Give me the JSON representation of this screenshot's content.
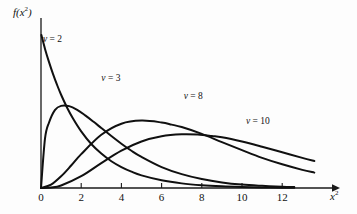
{
  "chart_data": {
    "type": "line",
    "title": "",
    "subtitle": "",
    "xlabel": "x²",
    "ylabel": "f(x²)",
    "xlabel_html": "x<sup>2</sup>",
    "ylabel_html": "f(x<sup>2</sup>)",
    "grid": false,
    "legend_position": "inline-annotations",
    "xlim": [
      0,
      13.8
    ],
    "ylim": [
      0,
      0.52
    ],
    "xticks": [
      0,
      2,
      4,
      6,
      8,
      10,
      12
    ],
    "xtick_labels": [
      "0",
      "2",
      "4",
      "6",
      "8",
      "10",
      "12"
    ],
    "yticks": [],
    "ytick_labels": [],
    "series": [
      {
        "name": "ν = 2",
        "label": "ν = 2",
        "nu": 2,
        "color": "#101010",
        "annotation": {
          "text": "ν = 2",
          "x": 0.1,
          "y": 0.48
        },
        "x": [
          0.02,
          0.2,
          0.4,
          0.6,
          0.8,
          1.0,
          1.3,
          1.6,
          2.0,
          2.5,
          3.0,
          3.5,
          4.0,
          4.5,
          5.0,
          6.0,
          7.0,
          8.0,
          9.0,
          10.0,
          11.0,
          12.0,
          12.6
        ],
        "y": [
          0.497,
          0.452,
          0.409,
          0.37,
          0.335,
          0.303,
          0.261,
          0.225,
          0.184,
          0.143,
          0.112,
          0.087,
          0.068,
          0.053,
          0.041,
          0.025,
          0.015,
          0.009,
          0.0055,
          0.0034,
          0.002,
          0.0012,
          0.0009
        ]
      },
      {
        "name": "ν = 3",
        "label": "ν = 3",
        "nu": 3,
        "color": "#101010",
        "annotation": {
          "text": "ν = 3",
          "x": 3.0,
          "y": 0.355
        },
        "x": [
          0.0,
          0.2,
          0.4,
          0.7,
          1.0,
          1.4,
          1.8,
          2.2,
          2.6,
          3.0,
          3.5,
          4.0,
          4.5,
          5.0,
          6.0,
          7.0,
          8.0,
          9.0,
          10.0,
          11.0,
          12.0,
          12.6
        ],
        "y": [
          0.0,
          0.161,
          0.213,
          0.254,
          0.267,
          0.266,
          0.254,
          0.236,
          0.216,
          0.195,
          0.169,
          0.144,
          0.121,
          0.101,
          0.068,
          0.045,
          0.029,
          0.018,
          0.011,
          0.007,
          0.004,
          0.003
        ]
      },
      {
        "name": "ν = 8",
        "label": "ν = 8",
        "nu": 8,
        "color": "#101010",
        "annotation": {
          "text": "ν = 8",
          "x": 7.1,
          "y": 0.295
        },
        "x": [
          0.0,
          0.5,
          1.0,
          1.5,
          2.0,
          3.0,
          4.0,
          5.0,
          6.0,
          6.5,
          7.0,
          8.0,
          9.0,
          10.0,
          11.0,
          12.0,
          13.0,
          13.6
        ],
        "y": [
          0.0,
          0.011,
          0.038,
          0.073,
          0.11,
          0.173,
          0.209,
          0.219,
          0.213,
          0.206,
          0.198,
          0.176,
          0.149,
          0.123,
          0.098,
          0.077,
          0.059,
          0.05
        ]
      },
      {
        "name": "ν = 10",
        "label": "ν = 10",
        "nu": 10,
        "color": "#101010",
        "annotation": {
          "text": "ν = 10",
          "x": 10.2,
          "y": 0.215
        },
        "x": [
          0.0,
          0.5,
          1.0,
          2.0,
          3.0,
          4.0,
          5.0,
          6.0,
          7.0,
          7.8,
          8.5,
          9.0,
          10.0,
          11.0,
          12.0,
          13.0,
          13.6
        ],
        "y": [
          0.0,
          0.0015,
          0.0081,
          0.0383,
          0.081,
          0.1213,
          0.151,
          0.168,
          0.1743,
          0.1735,
          0.169,
          0.165,
          0.151,
          0.134,
          0.116,
          0.098,
          0.088
        ]
      }
    ]
  },
  "axes": {
    "y_label": "f(x²)",
    "y_label_base": "f(x",
    "y_label_sup": "2",
    "y_label_tail": ")",
    "x_label_base": "x",
    "x_label_sup": "2"
  },
  "ticks": {
    "labels": [
      "0",
      "2",
      "4",
      "6",
      "8",
      "10",
      "12"
    ]
  },
  "annotations": [
    {
      "name": "nu-2",
      "symbol": "ν",
      "eq": " = ",
      "value": "2"
    },
    {
      "name": "nu-3",
      "symbol": "ν",
      "eq": " = ",
      "value": "3"
    },
    {
      "name": "nu-8",
      "symbol": "ν",
      "eq": " = ",
      "value": "8"
    },
    {
      "name": "nu-10",
      "symbol": "ν",
      "eq": " = ",
      "value": "10"
    }
  ],
  "colors": {
    "background": "#fdfdfd",
    "ink": "#101010",
    "axis": "#1a1a1a"
  }
}
